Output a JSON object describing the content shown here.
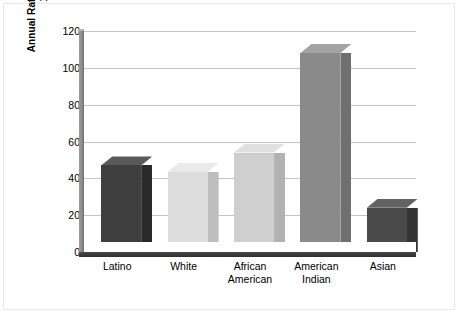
{
  "chart_data": {
    "type": "bar",
    "title": "",
    "subtitle": "",
    "xlabel": "",
    "ylabel": "Annual Rate per 1,000 Persons,\n1993–2000",
    "categories": [
      "Latino",
      "White",
      "African\nAmerican",
      "American\nIndian",
      "Asian"
    ],
    "values": [
      47,
      43.5,
      54,
      108,
      24
    ],
    "series": [
      {
        "name": "Annual Rate per 1,000 Persons, 1993-2000",
        "values": [
          47,
          43.5,
          54,
          108,
          24
        ]
      }
    ],
    "ylim": [
      0,
      120
    ],
    "yticks": [
      0,
      20,
      40,
      60,
      80,
      100,
      120
    ],
    "ytick_labels": [
      "0",
      "20",
      "40",
      "60",
      "80",
      "100",
      "120"
    ],
    "grid": true,
    "grid_axis": "y",
    "legend": false,
    "legend_position": "none",
    "style": "3d-bar",
    "bar_colors": [
      "#3f3f3f",
      "#dcdcdc",
      "#cfcfcf",
      "#8a8a8a",
      "#4a4a4a"
    ],
    "bar_side_colors": [
      "#2a2a2a",
      "#bdbdbd",
      "#b2b2b2",
      "#6f6f6f",
      "#343434"
    ],
    "bar_top_colors": [
      "#5a5a5a",
      "#eaeaea",
      "#e0e0e0",
      "#a3a3a3",
      "#636363"
    ],
    "shadow_color": "#c8c8c8",
    "gridline_color": "#c4c4c4",
    "axis_color": "#3a3a3a",
    "background_color": "#ffffff"
  }
}
